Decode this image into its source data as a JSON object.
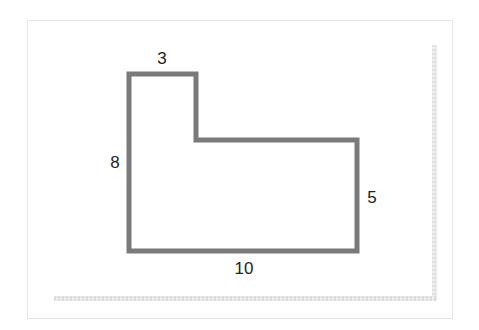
{
  "diagram": {
    "type": "composite-rectilinear-shape",
    "stroke_color": "#7a7a7a",
    "stroke_width": 5,
    "frame_border_color": "#e4e4e4",
    "label_color": "#222222",
    "vertices": [
      [
        129,
        74
      ],
      [
        196,
        74
      ],
      [
        196,
        140
      ],
      [
        357,
        140
      ],
      [
        357,
        251
      ],
      [
        129,
        251
      ]
    ],
    "labels": {
      "top": "3",
      "left": "8",
      "right": "5",
      "bottom": "10"
    },
    "label_positions": {
      "top": {
        "x": 162,
        "y": 58
      },
      "left": {
        "x": 115,
        "y": 162
      },
      "right": {
        "x": 372,
        "y": 197
      },
      "bottom": {
        "x": 244,
        "y": 268
      }
    }
  }
}
